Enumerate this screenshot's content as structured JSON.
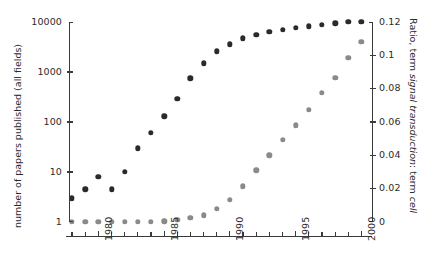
{
  "chart_data": {
    "type": "scatter",
    "title": "",
    "xlabel": "",
    "ylabel": "number of papers published (all fields)",
    "y2label": "Ratio, term signal transduction: term cell",
    "y2label_parts": [
      "Ratio, term ",
      "signal transduction",
      ": term ",
      "cell"
    ],
    "xlim": [
      1977.5,
      2000.5
    ],
    "ylim": [
      1,
      10000
    ],
    "yscale": "log",
    "y2lim": [
      0,
      0.12
    ],
    "y2scale": "linear",
    "grid": false,
    "legend": "none",
    "xticks": [
      1978,
      1979,
      1980,
      1981,
      1982,
      1983,
      1984,
      1985,
      1986,
      1987,
      1988,
      1989,
      1990,
      1991,
      1992,
      1993,
      1994,
      1995,
      1996,
      1997,
      1998,
      1999,
      2000
    ],
    "xticklabels": [
      "1980",
      "1985",
      "1990",
      "1995",
      "2000"
    ],
    "xticklabel_values": [
      1980,
      1985,
      1990,
      1995,
      2000
    ],
    "yticklabels": [
      "1",
      "10",
      "100",
      "1000",
      "10000"
    ],
    "ytickvalues": [
      1,
      10,
      100,
      1000,
      10000
    ],
    "y2ticklabels": [
      "0",
      "0.02",
      "0.04",
      "0.06",
      "0.08",
      "0.1",
      "0.12"
    ],
    "y2tickvalues": [
      0,
      0.02,
      0.04,
      0.06,
      0.08,
      0.1,
      0.12
    ],
    "colors": {
      "series1": "#2a2a2a",
      "series2": "#8a8a8a",
      "axis": "#3a3a3a",
      "background": "#ffffff"
    },
    "series": [
      {
        "name": "number of papers published (all fields)",
        "axis": "left",
        "color": "#2a2a2a",
        "marker": "circle",
        "x": [
          1978,
          1979,
          1980,
          1981,
          1982,
          1983,
          1984,
          1985,
          1986,
          1987,
          1988,
          1989,
          1990,
          1991,
          1992,
          1993,
          1994,
          1995,
          1996,
          1997,
          1998,
          1999,
          2000
        ],
        "values": [
          3,
          4.5,
          8,
          4.5,
          10,
          30,
          60,
          130,
          290,
          750,
          1500,
          2600,
          3600,
          4700,
          5500,
          6300,
          7000,
          7600,
          8200,
          8800,
          9500,
          10000,
          10000
        ]
      },
      {
        "name": "Ratio, term signal transduction: term cell",
        "axis": "right",
        "color": "#8a8a8a",
        "marker": "circle",
        "x": [
          1978,
          1979,
          1980,
          1981,
          1982,
          1983,
          1984,
          1985,
          1986,
          1987,
          1988,
          1989,
          1990,
          1991,
          1992,
          1993,
          1994,
          1995,
          1996,
          1997,
          1998,
          1999,
          2000
        ],
        "values": [
          0.0,
          0.0,
          0.0,
          0.0,
          0.0,
          0.0,
          0.0,
          0.0005,
          0.0015,
          0.0025,
          0.004,
          0.008,
          0.0135,
          0.0215,
          0.031,
          0.04,
          0.0495,
          0.058,
          0.0675,
          0.0775,
          0.0865,
          0.0985,
          0.108
        ]
      }
    ]
  }
}
